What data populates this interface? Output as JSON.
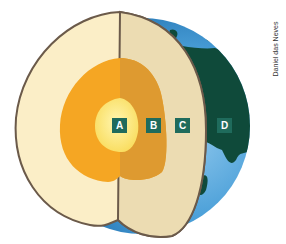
{
  "labels": [
    {
      "id": "A",
      "text": "A",
      "layer": "inner core",
      "x": 112,
      "y": 117
    },
    {
      "id": "B",
      "text": "B",
      "layer": "outer core",
      "x": 146,
      "y": 117
    },
    {
      "id": "C",
      "text": "C",
      "layer": "mantle",
      "x": 174,
      "y": 117
    },
    {
      "id": "D",
      "text": "D",
      "layer": "crust",
      "x": 217,
      "y": 117
    }
  ],
  "credit": "Daniel das Neves",
  "colors": {
    "label_bg": "#1f6b5c",
    "inner_core": "#fbe98a",
    "outer_core_light": "#f5a623",
    "outer_core_dark": "#de9a30",
    "mantle_light": "#fbeec7",
    "mantle_dark": "#ecdcb2",
    "ocean": "#3a90cf",
    "land": "#0f4a3a",
    "outline": "#6b5a4a"
  }
}
